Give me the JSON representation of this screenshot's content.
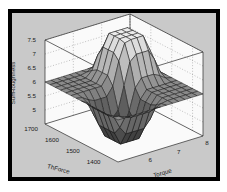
{
  "figure": {
    "outer_margin_color": "#ffffff",
    "frame_color": "#000000",
    "panel_background": "#c9c9c9",
    "wall_color": "#fafafa",
    "gridline_color": "#8f8f8f",
    "mesh_edge_color": "#161616",
    "box_edge_color": "#2a2a2a",
    "surface_color_low": "#323232",
    "surface_color_mid": "#8e8e8e",
    "surface_color_high": "#e8e8e8"
  },
  "chart_data": {
    "type": "surface",
    "title": "",
    "xlabel": "Torque",
    "ylabel": "ThForce",
    "zlabel": "SurfRoughness",
    "x": {
      "label": "Torque",
      "min": 5,
      "max": 8,
      "ticks": [
        {
          "value": 6,
          "label": "6"
        },
        {
          "value": 7,
          "label": "7"
        },
        {
          "value": 8,
          "label": "8"
        }
      ]
    },
    "y": {
      "label": "ThForce",
      "min": 1350,
      "max": 1700,
      "ticks": [
        {
          "value": 1400,
          "label": "1400"
        },
        {
          "value": 1500,
          "label": "1500"
        },
        {
          "value": 1600,
          "label": "1600"
        },
        {
          "value": 1700,
          "label": "1700"
        }
      ]
    },
    "z": {
      "label": "SurfRoughness",
      "min": 4.5,
      "max": 7.5,
      "ticks": [
        {
          "value": 5,
          "label": "5"
        },
        {
          "value": 5.5,
          "label": "5.5"
        },
        {
          "value": 6,
          "label": "6"
        },
        {
          "value": 6.5,
          "label": "6.5"
        },
        {
          "value": 7,
          "label": "7"
        },
        {
          "value": 7.5,
          "label": "7.5"
        }
      ]
    },
    "grid_x": [
      5,
      5.21,
      5.43,
      5.64,
      5.86,
      6.07,
      6.29,
      6.5,
      6.71,
      6.93,
      7.14,
      7.36,
      7.57,
      7.79,
      8
    ],
    "grid_y": [
      1350,
      1375,
      1400,
      1425,
      1450,
      1475,
      1500,
      1525,
      1550,
      1575,
      1600,
      1625,
      1650,
      1675,
      1700
    ],
    "z_values": [
      [
        6,
        6,
        6,
        6,
        6,
        6,
        6,
        6,
        6,
        6,
        6,
        6,
        6,
        6,
        6
      ],
      [
        6,
        5.97,
        5.87,
        5.8,
        5.8,
        5.8,
        5.8,
        5.86,
        5.96,
        6,
        6,
        6,
        6,
        6,
        6
      ],
      [
        6,
        5.87,
        5.41,
        5.11,
        5.11,
        5.11,
        5.11,
        5.37,
        5.81,
        6,
        6,
        6,
        6,
        6,
        6
      ],
      [
        6,
        5.8,
        5.11,
        4.65,
        4.65,
        4.65,
        4.65,
        5.04,
        5.72,
        6,
        6,
        6,
        6,
        6,
        6
      ],
      [
        6,
        5.8,
        5.11,
        4.65,
        4.65,
        4.65,
        4.65,
        5.04,
        5.72,
        6,
        6,
        6,
        6,
        6,
        6
      ],
      [
        6,
        5.8,
        5.11,
        4.65,
        4.65,
        4.65,
        4.65,
        5.04,
        5.72,
        6,
        6,
        6,
        6,
        6,
        6
      ],
      [
        6,
        5.8,
        5.11,
        4.65,
        4.65,
        4.65,
        4.72,
        5.27,
        6.03,
        6.32,
        6.32,
        6.32,
        6.21,
        6.05,
        6
      ],
      [
        6,
        5.86,
        5.37,
        5.04,
        5.04,
        5.04,
        5.27,
        6.08,
        6.86,
        7.07,
        7.07,
        7.07,
        6.7,
        6.16,
        6
      ],
      [
        6,
        5.96,
        5.81,
        5.72,
        5.72,
        5.72,
        6.03,
        6.86,
        7.44,
        7.5,
        7.5,
        7.5,
        6.99,
        6.23,
        6
      ],
      [
        6,
        6,
        6,
        6,
        6,
        6,
        6.32,
        7.07,
        7.5,
        7.5,
        7.5,
        7.5,
        6.99,
        6.23,
        6
      ],
      [
        6,
        6,
        6,
        6,
        6,
        6,
        6.32,
        7.07,
        7.5,
        7.5,
        7.5,
        7.5,
        6.99,
        6.23,
        6
      ],
      [
        6,
        6,
        6,
        6,
        6,
        6,
        6.32,
        7.07,
        7.5,
        7.5,
        7.5,
        7.5,
        6.99,
        6.23,
        6
      ],
      [
        6,
        6,
        6,
        6,
        6,
        6,
        6.21,
        6.7,
        6.99,
        6.99,
        6.99,
        6.99,
        6.65,
        6.15,
        6
      ],
      [
        6,
        6,
        6,
        6,
        6,
        6,
        6.05,
        6.16,
        6.23,
        6.23,
        6.23,
        6.23,
        6.15,
        6.03,
        6
      ],
      [
        6,
        6,
        6,
        6,
        6,
        6,
        6,
        6,
        6,
        6,
        6,
        6,
        6,
        6,
        6
      ]
    ],
    "colormap": "gray",
    "legend": "none",
    "grid": "dotted-walls"
  }
}
